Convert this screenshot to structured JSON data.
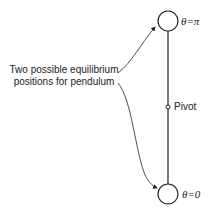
{
  "diagram": {
    "type": "pendulum-equilibrium",
    "caption_line1": "Two possible equilibrium",
    "caption_line2": "positions for pendulum",
    "top_label": "θ=π",
    "bottom_label": "θ=0",
    "pivot_label": "Pivot",
    "colors": {
      "line": "#222222",
      "background": "#ffffff"
    }
  }
}
